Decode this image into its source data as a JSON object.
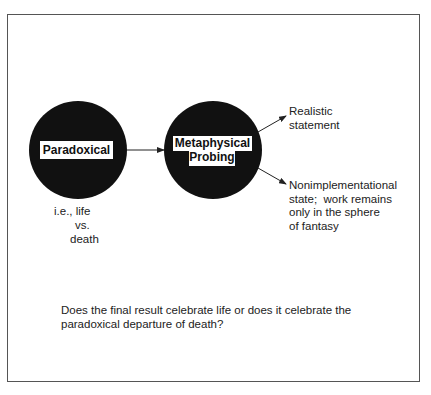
{
  "diagram": {
    "nodes": [
      {
        "id": "paradoxical",
        "label": "Paradoxical",
        "shape": "black-circle",
        "fill": "#111111"
      },
      {
        "id": "metaphysical-probing",
        "label_line1": "Metaphysical",
        "label_line2": "Probing",
        "shape": "black-circle",
        "fill": "#111111"
      }
    ],
    "edges": [
      {
        "from": "paradoxical",
        "to": "metaphysical-probing"
      },
      {
        "from": "metaphysical-probing",
        "to": "realistic-statement"
      },
      {
        "from": "metaphysical-probing",
        "to": "nonimplementational-state"
      }
    ],
    "outcomes": {
      "realistic": {
        "line1": "Realistic",
        "line2": "statement"
      },
      "nonimplementational": {
        "line1": "Nonimplementational",
        "line2": "state;  work remains",
        "line3": "only in the sphere",
        "line4": "of fantasy"
      }
    },
    "annotation": {
      "line1": "i.e., life",
      "line2": "vs.",
      "line3": "death"
    },
    "question": {
      "line1": "Does the final result celebrate life or does it celebrate the",
      "line2": "paradoxical departure of death?"
    }
  },
  "colors": {
    "circle_fill": "#111111",
    "frame_border": "#555555",
    "text": "#222222",
    "background": "#ffffff"
  }
}
